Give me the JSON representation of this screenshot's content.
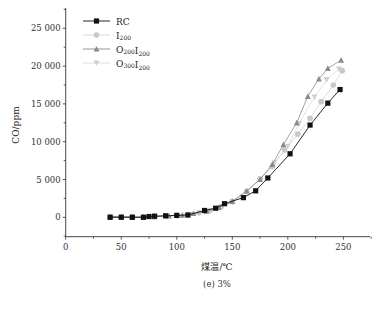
{
  "chart_data": {
    "type": "line",
    "title": "",
    "caption": "(e) 3%",
    "xlabel": "煤温/℃",
    "ylabel": "CO/ppm",
    "xlim": [
      0,
      275
    ],
    "ylim": [
      -2500,
      27500
    ],
    "x_ticks": [
      0,
      50,
      100,
      150,
      200,
      250
    ],
    "x_tick_labels": [
      "0",
      "50",
      "100",
      "150",
      "200",
      "250"
    ],
    "y_ticks": [
      0,
      5000,
      10000,
      15000,
      20000,
      25000
    ],
    "y_tick_labels": [
      "0",
      "5 000",
      "10 000",
      "15 000",
      "20 000",
      "25 000"
    ],
    "grid": false,
    "legend_position": "upper-left",
    "series": [
      {
        "name": "RC",
        "name_main": "RC",
        "name_sub": "",
        "marker": "square",
        "color": "#111111",
        "marker_color": "#111111",
        "x": [
          40,
          50,
          60,
          70,
          75,
          80,
          90,
          100,
          110,
          125,
          135,
          143,
          160,
          171,
          182,
          202,
          220,
          236,
          247
        ],
        "y": [
          0,
          0,
          0,
          0,
          100,
          150,
          200,
          250,
          300,
          900,
          1200,
          1800,
          2600,
          3500,
          5200,
          8400,
          12200,
          15100,
          16900
        ]
      },
      {
        "name": "I200",
        "name_main": "I",
        "name_sub": "200",
        "marker": "circle",
        "color": "#d4d4d4",
        "marker_color": "#c8c8c8",
        "x": [
          40,
          50,
          60,
          70,
          80,
          90,
          100,
          110,
          120,
          130,
          140,
          150,
          163,
          175,
          186,
          197,
          209,
          220,
          230,
          241,
          249
        ],
        "y": [
          50,
          50,
          50,
          50,
          100,
          150,
          250,
          350,
          600,
          900,
          1400,
          2100,
          3400,
          5100,
          6700,
          8900,
          11000,
          13100,
          15300,
          17500,
          19400
        ]
      },
      {
        "name": "O200I200",
        "name_main": "O",
        "name_sub": "200",
        "name_main2": "I",
        "name_sub2": "200",
        "marker": "triangle",
        "color": "#8a8a8a",
        "marker_color": "#8a8a8a",
        "x": [
          40,
          50,
          60,
          70,
          80,
          93,
          105,
          115,
          127,
          138,
          150,
          163,
          175,
          186,
          196,
          208,
          218,
          228,
          236,
          248
        ],
        "y": [
          100,
          100,
          50,
          50,
          100,
          200,
          300,
          500,
          800,
          1300,
          2100,
          3500,
          5000,
          7000,
          9600,
          12500,
          16000,
          18300,
          19700,
          20800
        ]
      },
      {
        "name": "O300I200",
        "name_main": "O",
        "name_sub": "300",
        "name_main2": "I",
        "name_sub2": "200",
        "marker": "triangle-down",
        "color": "#dcdcdc",
        "marker_color": "#cfcfcf",
        "x": [
          40,
          50,
          60,
          70,
          80,
          90,
          100,
          112,
          125,
          138,
          150,
          163,
          175,
          188,
          200,
          210,
          224,
          235,
          246
        ],
        "y": [
          50,
          50,
          50,
          0,
          50,
          150,
          200,
          350,
          700,
          1200,
          2000,
          3400,
          5000,
          7200,
          9400,
          12400,
          15900,
          18200,
          19600
        ]
      }
    ]
  },
  "layout": {
    "plot_left": 65.7,
    "plot_right": 370,
    "plot_top": 8,
    "plot_bottom": 236.7,
    "x0_px": 65.7,
    "x_px_per_unit": 1.1107,
    "y0_px": 217.3,
    "y_px_per_unit": 0.00756
  }
}
